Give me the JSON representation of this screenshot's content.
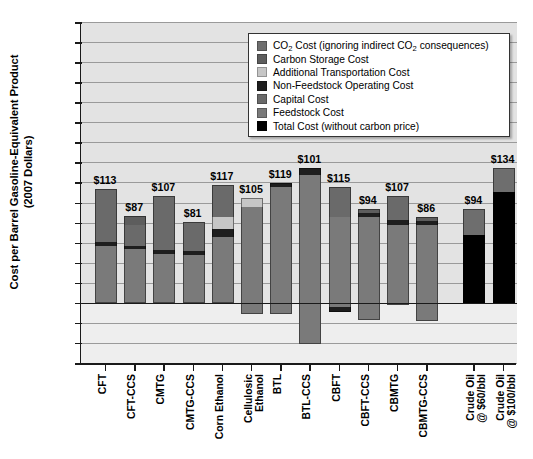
{
  "chart_data": {
    "type": "bar",
    "title": "",
    "xlabel": "",
    "ylabel": "Cost per Barrel Gasoline-Equivalent Product (2007 Dollars)",
    "ylabel_line1": "Cost per Barrel Gasoline-Equivalent Product",
    "ylabel_line2": "(2007 Dollars)",
    "ylim": [
      -60,
      280
    ],
    "yticks": [
      280,
      260,
      240,
      220,
      200,
      180,
      160,
      140,
      120,
      100,
      80,
      60,
      40,
      20,
      0,
      -20,
      -40,
      -60
    ],
    "grid": true,
    "stacked": true,
    "legend_position": "upper-right",
    "categories": [
      "CFT",
      "CFT-CCS",
      "CMTG",
      "CMTG-CCS",
      "Corn Ethanol",
      "Cellulosic\nEthanol",
      "BTL",
      "BTL-CCS",
      "CBFT",
      "CBFT-CCS",
      "CBMTG",
      "CBMTG-CCS",
      "Crude Oil\n@ $60/bbl",
      "Crude Oil\n@ $100/bbl"
    ],
    "value_labels": [
      "$113",
      "$87",
      "$107",
      "$81",
      "$117",
      "$105",
      "$119",
      "$101",
      "$115",
      "$94",
      "$107",
      "$86",
      "$94",
      "$134"
    ],
    "totals": [
      113,
      87,
      107,
      81,
      117,
      105,
      119,
      101,
      115,
      94,
      107,
      86,
      94,
      134
    ],
    "series": [
      {
        "name": "CO2 Cost (ignoring indirect CO2 consequences)",
        "color": "#6e6e6e",
        "values": [
          0,
          0,
          0,
          0,
          0,
          0,
          0,
          0,
          0,
          0,
          0,
          0,
          26,
          40
        ]
      },
      {
        "name": "Carbon Storage Cost",
        "color": "#5d5d5d",
        "values": [
          0,
          9,
          0,
          9,
          0,
          0,
          0,
          11,
          0,
          7,
          0,
          6,
          0,
          0
        ]
      },
      {
        "name": "Additional Transportation Cost",
        "color": "#c6c6c6",
        "values": [
          0,
          0,
          0,
          0,
          12,
          6,
          0,
          0,
          0,
          0,
          0,
          0,
          0,
          0
        ]
      },
      {
        "name": "Non-Feedstock Operating Cost",
        "color": "#1e1e1e",
        "values": [
          4,
          4,
          4,
          4,
          6,
          3,
          4,
          4,
          4,
          4,
          4,
          4,
          0,
          0
        ]
      },
      {
        "name": "Capital Cost",
        "color": "#6a6a6a",
        "values": [
          56,
          59,
          52,
          52,
          33,
          52,
          60,
          63,
          59,
          57,
          55,
          52,
          0,
          0
        ]
      },
      {
        "name": "Feedstock Cost",
        "color": "#7a7a7a",
        "values": [
          53,
          53,
          51,
          52,
          66,
          54,
          55,
          63,
          52,
          52,
          48,
          48,
          0,
          0
        ]
      },
      {
        "name": "Total Cost (without carbon price)",
        "color": "#000000",
        "values": [
          0,
          0,
          0,
          0,
          0,
          0,
          0,
          0,
          0,
          0,
          0,
          0,
          68,
          94
        ]
      }
    ],
    "bar_ranges_note": "Bars are drawn from a bottom value (may be negative) up to the labeled total",
    "bars": [
      {
        "category": "CFT",
        "label": "$113",
        "bottom": 0,
        "top": 113,
        "segments": [
          {
            "name": "feedstock",
            "from": 0,
            "to": 57,
            "color": "#7a7a7a"
          },
          {
            "name": "non-feedstock-operating",
            "from": 57,
            "to": 61,
            "color": "#1e1e1e"
          },
          {
            "name": "capital",
            "from": 61,
            "to": 113,
            "color": "#6a6a6a"
          }
        ]
      },
      {
        "category": "CFT-CCS",
        "label": "$87",
        "bottom": 0,
        "top": 87,
        "segments": [
          {
            "name": "feedstock",
            "from": 0,
            "to": 54,
            "color": "#7a7a7a"
          },
          {
            "name": "non-feedstock-operating",
            "from": 54,
            "to": 57,
            "color": "#1e1e1e"
          },
          {
            "name": "capital",
            "from": 57,
            "to": 78,
            "color": "#6a6a6a"
          },
          {
            "name": "carbon-storage",
            "from": 78,
            "to": 87,
            "color": "#5d5d5d"
          }
        ]
      },
      {
        "category": "CMTG",
        "label": "$107",
        "bottom": 0,
        "top": 107,
        "segments": [
          {
            "name": "feedstock",
            "from": 0,
            "to": 49,
            "color": "#7a7a7a"
          },
          {
            "name": "non-feedstock-operating",
            "from": 49,
            "to": 53,
            "color": "#1e1e1e"
          },
          {
            "name": "capital",
            "from": 53,
            "to": 107,
            "color": "#6a6a6a"
          }
        ]
      },
      {
        "category": "CMTG-CCS",
        "label": "$81",
        "bottom": 0,
        "top": 81,
        "segments": [
          {
            "name": "feedstock",
            "from": 0,
            "to": 48,
            "color": "#7a7a7a"
          },
          {
            "name": "non-feedstock-operating",
            "from": 48,
            "to": 52,
            "color": "#1e1e1e"
          },
          {
            "name": "capital",
            "from": 52,
            "to": 81,
            "color": "#6a6a6a"
          }
        ]
      },
      {
        "category": "Corn Ethanol",
        "label": "$117",
        "bottom": 0,
        "top": 117,
        "segments": [
          {
            "name": "feedstock",
            "from": 0,
            "to": 66,
            "color": "#7a7a7a"
          },
          {
            "name": "non-feedstock-operating",
            "from": 66,
            "to": 74,
            "color": "#1e1e1e"
          },
          {
            "name": "additional-transportation",
            "from": 74,
            "to": 86,
            "color": "#c6c6c6"
          },
          {
            "name": "capital",
            "from": 86,
            "to": 117,
            "color": "#6a6a6a"
          }
        ]
      },
      {
        "category": "Cellulosic Ethanol",
        "label": "$105",
        "bottom": -11,
        "top": 105,
        "segments": [
          {
            "name": "feedstock",
            "from": -11,
            "to": 96,
            "color": "#7a7a7a"
          },
          {
            "name": "additional-transportation",
            "from": 96,
            "to": 105,
            "color": "#c6c6c6"
          }
        ]
      },
      {
        "category": "BTL",
        "label": "$119",
        "bottom": -11,
        "top": 119,
        "segments": [
          {
            "name": "feedstock",
            "from": -11,
            "to": 115,
            "color": "#7a7a7a"
          },
          {
            "name": "non-feedstock-operating",
            "from": 115,
            "to": 119,
            "color": "#1e1e1e"
          }
        ]
      },
      {
        "category": "BTL-CCS",
        "label": "$101",
        "bottom": -41,
        "top": 134,
        "segments": [
          {
            "name": "feedstock",
            "from": -41,
            "to": 127,
            "color": "#7a7a7a"
          },
          {
            "name": "non-feedstock-operating",
            "from": 127,
            "to": 134,
            "color": "#1e1e1e"
          }
        ]
      },
      {
        "category": "CBFT",
        "label": "$115",
        "bottom": -9,
        "top": 115,
        "segments": [
          {
            "name": "non-feedstock-operating",
            "from": -9,
            "to": -4,
            "color": "#1e1e1e"
          },
          {
            "name": "feedstock",
            "from": -4,
            "to": 86,
            "color": "#7a7a7a"
          },
          {
            "name": "capital",
            "from": 86,
            "to": 115,
            "color": "#6a6a6a"
          }
        ]
      },
      {
        "category": "CBFT-CCS",
        "label": "$94",
        "bottom": -17,
        "top": 94,
        "segments": [
          {
            "name": "feedstock",
            "from": -17,
            "to": 86,
            "color": "#7a7a7a"
          },
          {
            "name": "non-feedstock-operating",
            "from": 86,
            "to": 90,
            "color": "#1e1e1e"
          },
          {
            "name": "carbon-storage",
            "from": 90,
            "to": 94,
            "color": "#5d5d5d"
          }
        ]
      },
      {
        "category": "CBMTG",
        "label": "$107",
        "bottom": -2,
        "top": 107,
        "segments": [
          {
            "name": "feedstock",
            "from": -2,
            "to": 78,
            "color": "#7a7a7a"
          },
          {
            "name": "non-feedstock-operating",
            "from": 78,
            "to": 83,
            "color": "#1e1e1e"
          },
          {
            "name": "capital",
            "from": 83,
            "to": 107,
            "color": "#6a6a6a"
          }
        ]
      },
      {
        "category": "CBMTG-CCS",
        "label": "$86",
        "bottom": -18,
        "top": 86,
        "segments": [
          {
            "name": "feedstock",
            "from": -18,
            "to": 78,
            "color": "#7a7a7a"
          },
          {
            "name": "non-feedstock-operating",
            "from": 78,
            "to": 82,
            "color": "#1e1e1e"
          },
          {
            "name": "carbon-storage",
            "from": 82,
            "to": 86,
            "color": "#5d5d5d"
          }
        ]
      },
      {
        "category": "Crude Oil @ $60/bbl",
        "label": "$94",
        "bottom": 0,
        "top": 94,
        "segments": [
          {
            "name": "total-cost",
            "from": 0,
            "to": 68,
            "color": "#000000"
          },
          {
            "name": "co2-cost",
            "from": 68,
            "to": 94,
            "color": "#6e6e6e"
          }
        ]
      },
      {
        "category": "Crude Oil @ $100/bbl",
        "label": "$134",
        "bottom": 0,
        "top": 134,
        "segments": [
          {
            "name": "total-cost",
            "from": 0,
            "to": 110,
            "color": "#000000"
          },
          {
            "name": "co2-cost",
            "from": 110,
            "to": 134,
            "color": "#6e6e6e"
          }
        ]
      }
    ]
  },
  "legend": {
    "items": [
      {
        "label": "CO2 Cost (ignoring indirect CO2 consequences)",
        "color": "#6e6e6e",
        "has_subscript": true,
        "pre": "CO",
        "sub": "2",
        "post": " Cost (ignoring indirect CO",
        "sub2": "2",
        "post2": " consequences)"
      },
      {
        "label": "Carbon Storage Cost",
        "color": "#5d5d5d",
        "has_subscript": false
      },
      {
        "label": "Additional Transportation Cost",
        "color": "#c6c6c6",
        "has_subscript": false
      },
      {
        "label": "Non-Feedstock Operating Cost",
        "color": "#1e1e1e",
        "has_subscript": false
      },
      {
        "label": "Capital Cost",
        "color": "#6a6a6a",
        "has_subscript": false
      },
      {
        "label": "Feedstock Cost",
        "color": "#7a7a7a",
        "has_subscript": false
      },
      {
        "label": "Total Cost (without carbon price)",
        "color": "#000000",
        "has_subscript": false
      }
    ]
  },
  "colors": {
    "plot_background": "#e3e3e3",
    "negative_band": "#eeeeee",
    "gridline": "#9a9a9a",
    "axis": "#1a1a1a"
  }
}
